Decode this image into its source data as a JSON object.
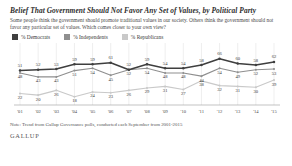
{
  "title": "Belief That Government Should Not Favor Any Set of Values, by Political Party",
  "subtitle": "Some people think the government should promote traditional values in our society. Others think the government should not favor any particular set of values. Which comes closer to your own view?",
  "legend": {
    "items": [
      {
        "label": "% Democrats",
        "color": "#3f3f3f"
      },
      {
        "label": "% Independents",
        "color": "#8f8f8f"
      },
      {
        "label": "% Republicans",
        "color": "#c9c9c9"
      }
    ]
  },
  "note": "Note: Trend from Gallup Governance polls, conducted each September from 2001-2015",
  "brand": "GALLUP",
  "chart_data": {
    "type": "line",
    "title": "Belief That Government Should Not Favor Any Set of Values, by Political Party",
    "xlabel": "",
    "ylabel": "",
    "ylim": [
      10,
      72
    ],
    "grid": "vertical",
    "legend_position": "top-left",
    "categories": [
      "'01",
      "'02",
      "'03",
      "'04",
      "'05",
      "'06",
      "'07",
      "'08",
      "'09",
      "'10",
      "'11",
      "'12",
      "'13",
      "'14",
      "'15"
    ],
    "series": [
      {
        "name": "% Democrats",
        "color": "#3f3f3f",
        "values": [
          51,
          52,
          53,
          59,
          59,
          61,
          52,
          59,
          54,
          54,
          58,
          66,
          60,
          58,
          62
        ]
      },
      {
        "name": "% Independents",
        "color": "#8f8f8f",
        "values": [
          48,
          43,
          43,
          51,
          54,
          45,
          52,
          54,
          48,
          48,
          44,
          54,
          49,
          52,
          53
        ]
      },
      {
        "name": "% Republicans",
        "color": "#c9c9c9",
        "values": [
          22,
          20,
          26,
          18,
          24,
          23,
          26,
          29,
          31,
          27,
          38,
          32,
          31,
          30,
          39
        ]
      }
    ]
  }
}
